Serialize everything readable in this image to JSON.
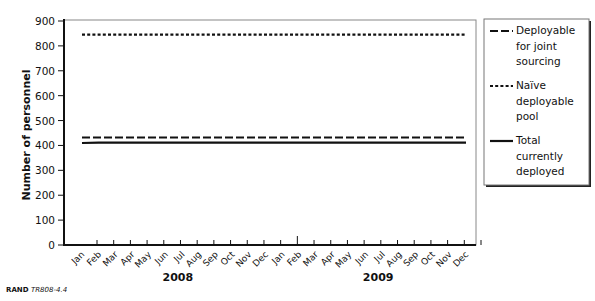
{
  "chart_data": {
    "type": "line",
    "title": "",
    "xlabel": "",
    "ylabel": "Number of personnel",
    "ylim": [
      0,
      900
    ],
    "yticks": [
      0,
      100,
      200,
      300,
      400,
      500,
      600,
      700,
      800,
      900
    ],
    "x": [
      "Jan",
      "Feb",
      "Mar",
      "Apr",
      "May",
      "Jun",
      "Jul",
      "Aug",
      "Sep",
      "Oct",
      "Nov",
      "Dec",
      "Jan",
      "Feb",
      "Mar",
      "Apr",
      "May",
      "Jun",
      "Jul",
      "Aug",
      "Sep",
      "Oct",
      "Nov",
      "Dec"
    ],
    "year_labels": [
      {
        "label": "2008",
        "center_index": 5.5
      },
      {
        "label": "2009",
        "center_index": 17.5
      }
    ],
    "grid": false,
    "legend_position": "right",
    "series": [
      {
        "name": "Deployable for joint sourcing",
        "style": "dashed",
        "values": [
          432,
          432,
          432,
          432,
          432,
          432,
          432,
          432,
          432,
          432,
          432,
          432,
          432,
          432,
          432,
          432,
          432,
          432,
          432,
          432,
          432,
          432,
          432,
          432
        ]
      },
      {
        "name": "Naïve deployable pool",
        "style": "dotted",
        "values": [
          845,
          845,
          845,
          845,
          845,
          845,
          845,
          845,
          845,
          845,
          845,
          845,
          845,
          845,
          845,
          845,
          845,
          845,
          845,
          845,
          845,
          845,
          845,
          845
        ]
      },
      {
        "name": "Total currently deployed",
        "style": "solid",
        "values": [
          410,
          411,
          411,
          411,
          411,
          411,
          411,
          411,
          411,
          411,
          411,
          411,
          411,
          411,
          411,
          411,
          411,
          411,
          411,
          411,
          411,
          411,
          411,
          411
        ]
      }
    ],
    "source": "RAND TR808-4.4"
  },
  "legend": {
    "items": [
      {
        "lines": [
          "Deployable",
          "for joint",
          "sourcing"
        ]
      },
      {
        "lines": [
          "Naïve",
          "deployable",
          "pool"
        ]
      },
      {
        "lines": [
          "Total",
          "currently",
          "deployed"
        ]
      }
    ]
  },
  "source": {
    "org": "RAND",
    "id": "TR808-4.4"
  }
}
